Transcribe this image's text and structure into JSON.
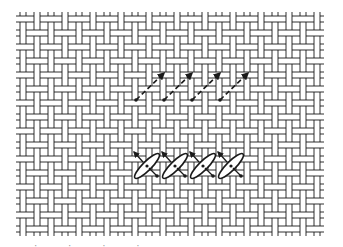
{
  "figure": {
    "type": "needlework stitch diagram",
    "background": "#ffffff",
    "ink_color": "#1a1a1a",
    "canvas": {
      "name": "woven canvas mesh",
      "x": 16,
      "y": 12,
      "width": 314,
      "height": 222,
      "cell": 14,
      "thread_gap": 3
    },
    "upper_row": {
      "label": "first pass - dashed diagonal stitches",
      "count": 4,
      "start": [
        136,
        100
      ],
      "end": [
        164,
        73
      ],
      "spacing": 28
    },
    "lower_row": {
      "label": "second pass - crossed oval stitches",
      "count": 4,
      "center_start": [
        147,
        166
      ],
      "spacing": 28
    },
    "caption": "cut-off caption text"
  }
}
